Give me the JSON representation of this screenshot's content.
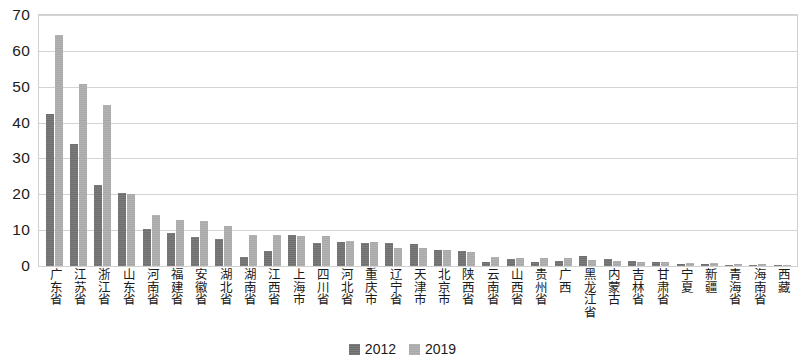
{
  "chart_data": {
    "type": "bar",
    "title": "",
    "subtitle": "",
    "xlabel": "",
    "ylabel": "",
    "ylim": [
      0,
      70
    ],
    "yticks": [
      0,
      10,
      20,
      30,
      40,
      50,
      60,
      70
    ],
    "grid": true,
    "legend_position": "bottom",
    "categories": [
      "广东省",
      "江苏省",
      "浙江省",
      "山东省",
      "河南省",
      "福建省",
      "安徽省",
      "湖北省",
      "湖南省",
      "江西省",
      "上海市",
      "四川省",
      "河北省",
      "重庆市",
      "辽宁省",
      "天津市",
      "北京市",
      "陕西省",
      "云南省",
      "山西省",
      "贵州省",
      "广西",
      "黑龙江省",
      "内蒙古",
      "吉林省",
      "甘肃省",
      "宁夏",
      "新疆",
      "青海省",
      "海南省",
      "西藏"
    ],
    "series": [
      {
        "name": "2012",
        "color": "#6e6e6e",
        "values": [
          42.5,
          34.0,
          22.7,
          20.3,
          10.4,
          9.1,
          8.2,
          7.5,
          2.6,
          4.3,
          8.6,
          6.3,
          6.6,
          6.5,
          6.4,
          6.2,
          4.6,
          4.3,
          1.1,
          2.0,
          1.1,
          1.4,
          2.8,
          1.9,
          1.5,
          1.1,
          0.7,
          0.6,
          0.4,
          0.4,
          0.2
        ]
      },
      {
        "name": "2019",
        "color": "#a8a8a8",
        "values": [
          64.3,
          50.8,
          45.0,
          20.1,
          14.1,
          12.7,
          12.6,
          11.2,
          8.7,
          8.7,
          8.5,
          8.3,
          7.0,
          6.6,
          5.0,
          4.9,
          4.5,
          4.0,
          2.5,
          2.3,
          2.2,
          2.1,
          1.6,
          1.5,
          1.1,
          1.0,
          0.9,
          0.8,
          0.5,
          0.5,
          0.3
        ]
      }
    ],
    "legend": [
      {
        "label": "2012",
        "color": "#6e6e6e"
      },
      {
        "label": "2019",
        "color": "#a8a8a8"
      }
    ]
  }
}
